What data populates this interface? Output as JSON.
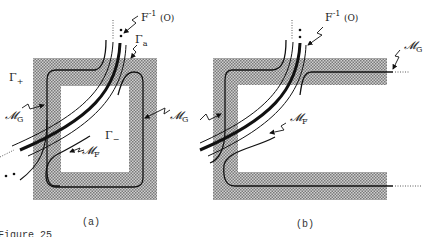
{
  "figure": {
    "caption": "Figure 25",
    "shade_color": "#9a9a9a",
    "line_color": "#111111"
  },
  "panel_a": {
    "label": "(a)",
    "preimage_label": {
      "main": "F",
      "sup": "-1",
      "arg": "(O)"
    },
    "gamma_a": {
      "main": "Γ",
      "sub": "a"
    },
    "gamma_plus": {
      "main": "Γ",
      "sub": "+"
    },
    "gamma_minus": {
      "main": "Γ",
      "sub": "−"
    },
    "m_g_left": {
      "main": "𝓜",
      "sub": "G"
    },
    "m_g_right": {
      "main": "𝓜",
      "sub": "G"
    },
    "m_f": {
      "main": "𝓜",
      "sub": "F"
    }
  },
  "panel_b": {
    "label": "(b)",
    "preimage_label": {
      "main": "F",
      "sup": "-1",
      "arg": "(O)"
    },
    "m_g": {
      "main": "𝓜",
      "sub": "G"
    },
    "m_f": {
      "main": "𝓜",
      "sub": "F"
    }
  }
}
